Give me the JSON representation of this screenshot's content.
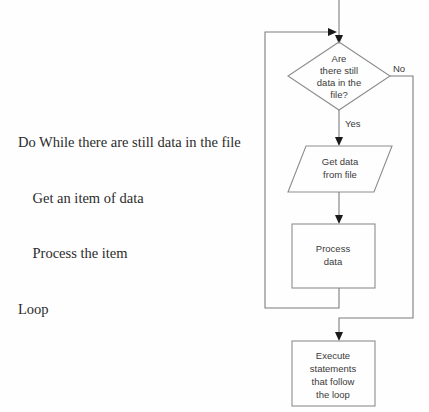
{
  "pseudocode": {
    "lines": [
      "Do While there are still data in the file",
      "    Get an item of data",
      "    Process the item",
      "Loop"
    ]
  },
  "flowchart": {
    "decision": {
      "lines": [
        "Are",
        "there still",
        "data in the",
        "file?"
      ]
    },
    "input_output": {
      "lines": [
        "Get data",
        "from file"
      ]
    },
    "process": {
      "lines": [
        "Process",
        "data"
      ]
    },
    "terminal": {
      "lines": [
        "Execute",
        "statements",
        "that follow",
        "the loop"
      ]
    },
    "labels": {
      "yes": "Yes",
      "no": "No"
    }
  },
  "colors": {
    "shape_stroke": "#8d8d8d",
    "line_stroke": "#7d7d7d",
    "arrow_fill": "#1a1a1a",
    "text": "#3a3a3a",
    "pseudocode_text": "#2b2b2b",
    "background": "#fefefe"
  }
}
